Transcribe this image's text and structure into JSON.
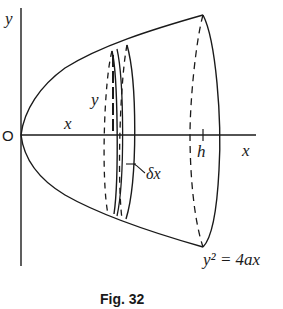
{
  "figure": {
    "caption": "Fig. 32",
    "equation": "y² = 4ax",
    "labels": {
      "y_axis": "y",
      "x_axis": "x",
      "origin": "O",
      "x_distance": "x",
      "y_height": "y",
      "h": "h",
      "delta_x": "δx"
    },
    "colors": {
      "stroke": "#1a1a1a",
      "background": "#ffffff"
    }
  }
}
